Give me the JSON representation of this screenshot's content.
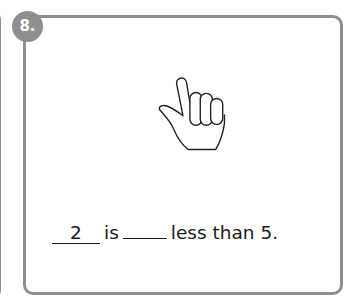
{
  "card": {
    "number": "8.",
    "image_icon": "hand-showing-number-icon"
  },
  "sentence": {
    "blank_1_value": "2",
    "word_is": "is",
    "blank_2_value": "",
    "tail": "less than 5."
  },
  "colors": {
    "border": "#8e8e8e",
    "badge": "#8e8e8e",
    "text": "#1c1c1c"
  }
}
